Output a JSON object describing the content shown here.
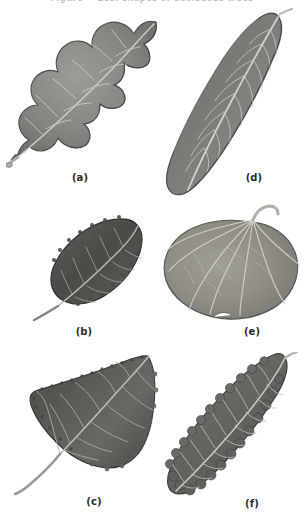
{
  "plate": {
    "top_caption_partial": "Figure — Leaf shapes of deciduous trees",
    "background_color": "#ffffff",
    "label_color": "#2b2b2b",
    "figure_count": 6
  },
  "figures": [
    {
      "key": "a",
      "label": "(a)",
      "subject": "oak-leaf",
      "description": "Deeply lobed oak leaf with rounded lobes and long petiole, oriented diagonally up-right",
      "orientation_deg": -35,
      "tone": "mid-gray",
      "fill": "#8b8b8b",
      "vein_color": "#d8d6d2",
      "outline_color": "#4e4e4e"
    },
    {
      "key": "b",
      "label": "(b)",
      "subject": "beech-leaf",
      "description": "Small dark elliptic leaf with finely toothed margin and straight pinnate veins",
      "orientation_deg": -28,
      "tone": "dark-gray",
      "fill": "#54544f",
      "vein_color": "#bdbab2",
      "outline_color": "#2f2f2c"
    },
    {
      "key": "c",
      "label": "(c)",
      "subject": "cottonwood-leaf",
      "description": "Broad triangular deltoid leaf with crenate margin and very long slender petiole",
      "orientation_deg": -20,
      "tone": "dark-gray",
      "fill": "#5e5e5a",
      "vein_color": "#c4c1bb",
      "outline_color": "#333330"
    },
    {
      "key": "d",
      "label": "(d)",
      "subject": "lanceolate-leaf",
      "description": "Long oblong-lanceolate entire-margined leaf with prominent midrib, tilted diagonally",
      "orientation_deg": -30,
      "tone": "mid-gray",
      "fill": "#83837f",
      "vein_color": "#d5d3cd",
      "outline_color": "#4a4a47"
    },
    {
      "key": "e",
      "label": "(e)",
      "subject": "aspen-leaf",
      "description": "Nearly round orbicular leaf with palmate veins and short curved petiole at the top",
      "orientation_deg": 0,
      "tone": "light-mid-gray",
      "fill": "#97968f",
      "vein_color": "#dedcd5",
      "outline_color": "#5a5a56"
    },
    {
      "key": "f",
      "label": "(f)",
      "subject": "chestnut-leaf",
      "description": "Narrow oblong leaf with coarse rounded-serrate margin and strongly parallel pinnate veins",
      "orientation_deg": -40,
      "tone": "mid-dark-gray",
      "fill": "#6e6e69",
      "vein_color": "#cfccc5",
      "outline_color": "#3b3b38"
    }
  ]
}
